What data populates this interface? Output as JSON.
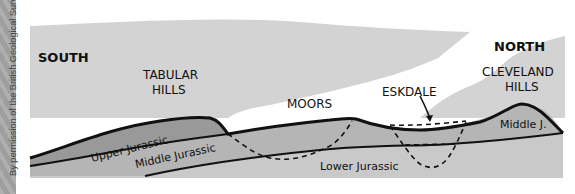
{
  "credit": "By permission of the British Geological Survey",
  "directions": {
    "south": "SOUTH",
    "north": "NORTH"
  },
  "places": {
    "tabular_hills_1": "TABULAR",
    "tabular_hills_2": "HILLS",
    "moors": "MOORS",
    "eskdale": "ESKDALE",
    "cleveland_hills_1": "CLEVELAND",
    "cleveland_hills_2": "HILLS"
  },
  "layers": {
    "upper": "Upper Jurassic",
    "middle": "Middle Jurassic",
    "middle_short": "Middle J.",
    "lower": "Lower Jurassic"
  },
  "colors": {
    "sky": "#d3d3d3",
    "land_band": "#ffffff",
    "upper_jurassic": "#999999",
    "middle_jurassic": "#b5b5b5",
    "lower_jurassic": "#c9c9c9",
    "outline": "#111111"
  }
}
